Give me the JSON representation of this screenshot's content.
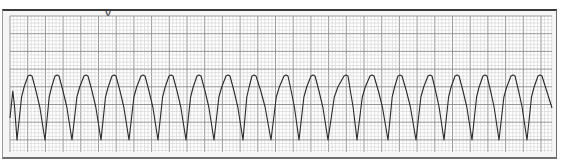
{
  "heading": {
    "fragment": "y"
  },
  "strip": {
    "grid_left": 10,
    "grid_top": 16,
    "grid_right": 552,
    "grid_bottom": 152,
    "minor_step": 3.54,
    "major_every": 5,
    "colors": {
      "paper": "#ffffff",
      "minor_grid": "#c8c8c8",
      "major_grid": "#8c8c8c",
      "trace": "#2a2a2a"
    }
  },
  "chart_data": {
    "type": "line",
    "title": "",
    "xlabel": "",
    "ylabel": "",
    "grid": true,
    "baseline_y": 110,
    "peak_y": 75,
    "trough_y": 140,
    "peaks_x": [
      30,
      57,
      86,
      114,
      143,
      171,
      199,
      228,
      254,
      286,
      313,
      346,
      372,
      400,
      430,
      457,
      485,
      513,
      540
    ],
    "troughs_x": [
      17,
      45,
      72,
      101,
      129,
      158,
      186,
      214,
      243,
      271,
      299,
      328,
      357,
      388,
      416,
      444,
      472,
      499,
      527
    ],
    "trace_start": [
      10,
      118
    ],
    "trace_end": [
      552,
      108
    ]
  }
}
